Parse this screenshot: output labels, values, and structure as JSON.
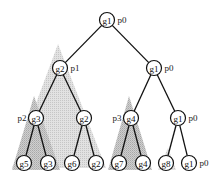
{
  "diagram": {
    "type": "tree",
    "nodes": [
      {
        "id": "root",
        "label": "g1",
        "proc": "p0",
        "level": 0,
        "parent": null
      },
      {
        "id": "n-l1-0",
        "label": "g2",
        "proc": "p1",
        "level": 1,
        "parent": "root"
      },
      {
        "id": "n-l1-1",
        "label": "g1",
        "proc": "p0",
        "level": 1,
        "parent": "root"
      },
      {
        "id": "n-l2-0",
        "label": "g3",
        "proc": "p2",
        "level": 2,
        "parent": "n-l1-0"
      },
      {
        "id": "n-l2-1",
        "label": "g2",
        "proc": "",
        "level": 2,
        "parent": "n-l1-0"
      },
      {
        "id": "n-l2-2",
        "label": "g4",
        "proc": "p3",
        "level": 2,
        "parent": "n-l1-1"
      },
      {
        "id": "n-l2-3",
        "label": "g1",
        "proc": "p0",
        "level": 2,
        "parent": "n-l1-1"
      },
      {
        "id": "n-l3-0",
        "label": "g5",
        "proc": "",
        "level": 3,
        "parent": "n-l2-0"
      },
      {
        "id": "n-l3-1",
        "label": "g3",
        "proc": "",
        "level": 3,
        "parent": "n-l2-0"
      },
      {
        "id": "n-l3-2",
        "label": "g6",
        "proc": "",
        "level": 3,
        "parent": "n-l2-1"
      },
      {
        "id": "n-l3-3",
        "label": "g2",
        "proc": "",
        "level": 3,
        "parent": "n-l2-1"
      },
      {
        "id": "n-l3-4",
        "label": "g7",
        "proc": "",
        "level": 3,
        "parent": "n-l2-2"
      },
      {
        "id": "n-l3-5",
        "label": "g4",
        "proc": "",
        "level": 3,
        "parent": "n-l2-2"
      },
      {
        "id": "n-l3-6",
        "label": "g8",
        "proc": "",
        "level": 3,
        "parent": "n-l2-3"
      },
      {
        "id": "n-l3-7",
        "label": "g1",
        "proc": "p0",
        "level": 3,
        "parent": "n-l2-3"
      }
    ],
    "shaded_subtrees": [
      {
        "root": "n-l1-0",
        "proc": "p1"
      },
      {
        "root": "n-l2-0",
        "proc": "p2"
      },
      {
        "root": "n-l2-2",
        "proc": "p3"
      },
      {
        "root": "n-l3-6",
        "proc": ""
      }
    ]
  }
}
